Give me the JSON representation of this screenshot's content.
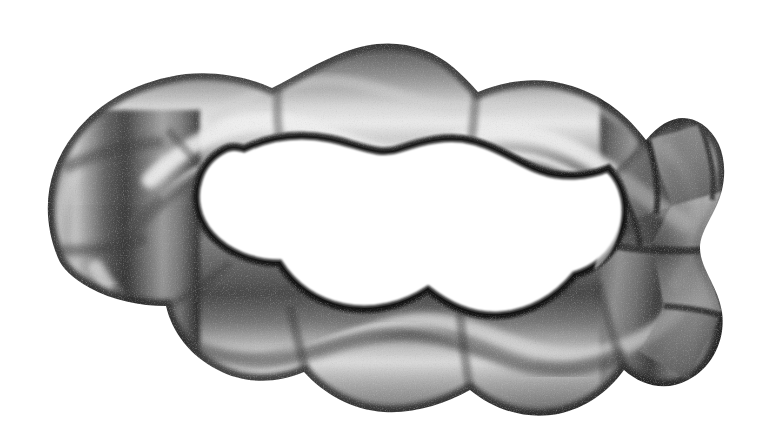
{
  "figure": {
    "kind": "3d-surface-render",
    "background_color": "#ffffff",
    "hole_color": "#ffffff",
    "lobe_count": 9,
    "twist_turns": 1,
    "render_style": "diffuse-shaded-with-specular-highlight-stripes",
    "noise": "scanned-halftone-grain"
  },
  "geometry": {
    "canvas_width": 761,
    "canvas_height": 438,
    "outer_bounds": {
      "left": 38,
      "top": 24,
      "right": 726,
      "bottom": 418
    },
    "center": {
      "x": 382,
      "y": 221
    },
    "outer_radius_x": 344,
    "outer_radius_y": 197,
    "inner_radius_x": 252,
    "inner_radius_y": 118,
    "ripple_amplitude_x": 22,
    "ripple_amplitude_y": 18
  },
  "palette": {
    "near_black": "#141414",
    "shadow": "#2a2a2a",
    "dark_gray": "#4a4a4a",
    "mid_gray": "#6f6f6f",
    "base_gray": "#8a8a8a",
    "light_gray": "#b4b4b4",
    "highlight": "#dcdcdc",
    "specular": "#f0f0f0",
    "white": "#ffffff"
  },
  "shading": {
    "light_direction": "upper-left",
    "bands": [
      {
        "name": "outer-rim-shadow",
        "value": "#1e1e1e"
      },
      {
        "name": "upper-diffuse",
        "value": "#7d7d7d"
      },
      {
        "name": "specular-stripe",
        "value": "#e2e2e2"
      },
      {
        "name": "mid-tone",
        "value": "#6a6a6a"
      },
      {
        "name": "core-shadow",
        "value": "#333333"
      },
      {
        "name": "lower-diffuse",
        "value": "#959595"
      },
      {
        "name": "inner-rim-shadow",
        "value": "#161616"
      }
    ]
  }
}
